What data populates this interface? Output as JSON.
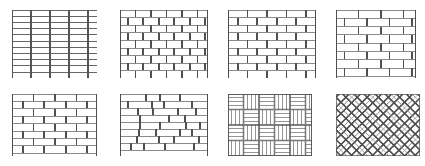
{
  "sheet": {
    "title": "Masonry bond pattern swatches",
    "background": "#ffffff",
    "width": 425,
    "height": 166,
    "stroke_dark": "#555555",
    "stroke_mid": "#777777",
    "stroke_light": "#9a9a9a",
    "columns": 4,
    "rows": 2
  },
  "swatches": [
    {
      "index": 1,
      "name": "stack-bond-grid",
      "label": "Stack bond",
      "x": 12,
      "y": 10,
      "w": 85,
      "h": 68,
      "type": "grid",
      "unit_w": 19,
      "unit_h": 6.2,
      "offset_ratio": 0,
      "head_stroke": "#555555",
      "bed_stroke": "#666666",
      "bed_weight": 1.0,
      "head_weight": 1.2
    },
    {
      "index": 2,
      "name": "running-bond-half",
      "label": "Running bond, half lap",
      "x": 120,
      "y": 10,
      "w": 88,
      "h": 68,
      "type": "running",
      "unit_w": 15.5,
      "unit_h": 7.6,
      "offset_ratio": 0.5,
      "head_stroke": "#4f4f4f",
      "bed_stroke": "#8a8a8a",
      "bed_weight": 1.0,
      "head_weight": 1.6
    },
    {
      "index": 3,
      "name": "running-bond-half-wide",
      "label": "Running bond, wide unit",
      "x": 228,
      "y": 10,
      "w": 88,
      "h": 68,
      "type": "running",
      "unit_w": 19.5,
      "unit_h": 7.6,
      "offset_ratio": 0.5,
      "head_stroke": "#4f4f4f",
      "bed_stroke": "#8a8a8a",
      "bed_weight": 1.0,
      "head_weight": 1.6
    },
    {
      "index": 4,
      "name": "running-bond-third-lap",
      "label": "Running bond, third lap",
      "x": 336,
      "y": 10,
      "w": 80,
      "h": 68,
      "type": "running",
      "unit_w": 22.5,
      "unit_h": 8.3,
      "offset_ratio": 0.38,
      "head_stroke": "#4f4f4f",
      "bed_stroke": "#8a8a8a",
      "bed_weight": 1.0,
      "head_weight": 1.7
    },
    {
      "index": 5,
      "name": "running-bond-long-unit",
      "label": "Running bond, long unit",
      "x": 12,
      "y": 94,
      "w": 85,
      "h": 62,
      "type": "running",
      "unit_w": 21.5,
      "unit_h": 7.4,
      "offset_ratio": 0.5,
      "head_stroke": "#4f4f4f",
      "bed_stroke": "#8a8a8a",
      "bed_weight": 1.0,
      "head_weight": 1.7
    },
    {
      "index": 6,
      "name": "random-ashlar-bond",
      "label": "Random stretcher bond",
      "x": 120,
      "y": 94,
      "w": 88,
      "h": 62,
      "type": "random",
      "unit_h": 7.0,
      "unit_widths": [
        26,
        14,
        20,
        30,
        17,
        24,
        12,
        28,
        19,
        22,
        15,
        25,
        18,
        27,
        13,
        21,
        29,
        16,
        23,
        11,
        26,
        20
      ],
      "row_starts": [
        0,
        -9,
        -4,
        -14,
        -6,
        -11,
        -2,
        -16,
        -7
      ],
      "head_stroke": "#4f4f4f",
      "bed_stroke": "#8a8a8a",
      "bed_weight": 1.0,
      "head_weight": 1.7
    },
    {
      "index": 7,
      "name": "basketweave-bond",
      "label": "Basketweave",
      "x": 228,
      "y": 94,
      "w": 84,
      "h": 62,
      "type": "basketweave",
      "cell": 15.5,
      "slats": 4,
      "cell_stroke": "#4f4f4f",
      "slat_stroke": "#8a8a8a",
      "cell_weight": 1.4,
      "slat_weight": 0.9
    },
    {
      "index": 8,
      "name": "herringbone-bond",
      "label": "Herringbone",
      "x": 336,
      "y": 94,
      "w": 84,
      "h": 62,
      "type": "herringbone",
      "unit_long": 22,
      "unit_short": 8,
      "angle": 45,
      "unit_stroke": "#4f4f4f",
      "inner_stroke": "#9a9a9a",
      "unit_weight": 1.3,
      "inner_weight": 0.8
    }
  ]
}
